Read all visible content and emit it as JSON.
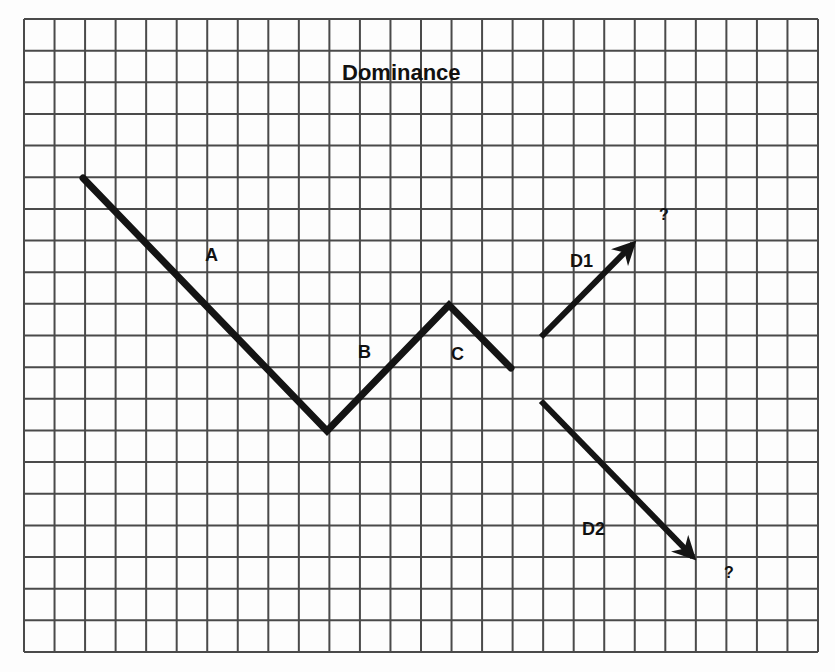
{
  "title": "Dominance",
  "grid": {
    "left": 24,
    "top": 19,
    "right": 818,
    "bottom": 652,
    "columns": 26,
    "rows": 20,
    "line_color": "#4a4a4a",
    "background": "#fdfdfd"
  },
  "line_color": "#141414",
  "segments": [
    {
      "id": "A",
      "label": "A",
      "points": [
        [
          83,
          178
        ],
        [
          327,
          431
        ]
      ],
      "label_pos": [
        205,
        246
      ]
    },
    {
      "id": "B",
      "label": "B",
      "points": [
        [
          327,
          431
        ],
        [
          449,
          305
        ]
      ],
      "label_pos": [
        358,
        343
      ]
    },
    {
      "id": "C",
      "label": "C",
      "points": [
        [
          449,
          305
        ],
        [
          511,
          368
        ]
      ],
      "label_pos": [
        451,
        345
      ]
    }
  ],
  "branches": [
    {
      "id": "D1",
      "label": "D1",
      "from": [
        541,
        337
      ],
      "to": [
        633,
        244
      ],
      "label_pos": [
        570,
        252
      ],
      "outcome_label": "?",
      "outcome_pos": [
        659,
        207
      ]
    },
    {
      "id": "D2",
      "label": "D2",
      "from": [
        541,
        401
      ],
      "to": [
        693,
        557
      ],
      "label_pos": [
        582,
        520
      ],
      "outcome_label": "?",
      "outcome_pos": [
        724,
        565
      ]
    }
  ]
}
